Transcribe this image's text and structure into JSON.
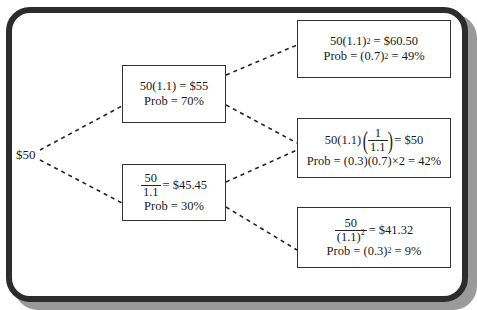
{
  "root": {
    "label": "$50"
  },
  "period1": {
    "up": {
      "value_expr": "50(1.1) = $55",
      "prob": "Prob = 70%"
    },
    "down": {
      "frac_num": "50",
      "frac_den": "1.1",
      "value_rest": "= $45.45",
      "prob": "Prob = 30%"
    }
  },
  "period2": {
    "upup": {
      "value_base": "50(1.1)",
      "value_exp": "2",
      "value_rest": " = $60.50",
      "prob_base": "Prob = (0.7)",
      "prob_exp": "2",
      "prob_rest": " = 49%"
    },
    "updown": {
      "value_pre": "50(1.1)",
      "frac_num": "1",
      "frac_den": "1.1",
      "value_rest": "= $50",
      "prob": "Prob = (0.3)(0.7)×2 = 42%"
    },
    "downdown": {
      "frac_num": "50",
      "frac_den_base": "(1.1)",
      "frac_den_exp": "2",
      "value_rest": "= $41.32",
      "prob_base": "Prob = (0.3)",
      "prob_exp": "2",
      "prob_rest": " = 9%"
    }
  },
  "colors": {
    "frame": "#2c2c2c",
    "shadow": "#9a9a9a",
    "line": "#222222"
  }
}
